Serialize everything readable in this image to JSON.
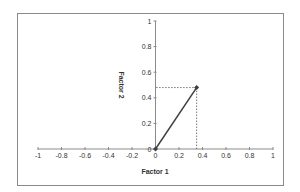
{
  "chart_data": {
    "type": "line",
    "title": "",
    "xlabel": "Factor 1",
    "ylabel": "Factor 2",
    "xlim": [
      -1,
      1
    ],
    "ylim": [
      0,
      1
    ],
    "x_ticks": [
      "-1",
      "-0.8",
      "-0.6",
      "-0.4",
      "-0.2",
      "0",
      "0.2",
      "0.4",
      "0.6",
      "0.8",
      "1"
    ],
    "y_ticks": [
      "0",
      "0.2",
      "0.4",
      "0.6",
      "0.8",
      "1"
    ],
    "grid": false,
    "legend": null,
    "series": [
      {
        "name": "Vector",
        "x": [
          0,
          0.35
        ],
        "y": [
          0,
          0.48
        ],
        "color": "#404040",
        "style": "solid"
      }
    ],
    "annotations": [
      {
        "type": "dashed-projection",
        "from": [
          0.35,
          0.48
        ],
        "to_axis": "x",
        "value": 0.35
      },
      {
        "type": "dashed-projection",
        "from": [
          0.35,
          0.48
        ],
        "to_axis": "y",
        "value": 0.48
      }
    ]
  }
}
